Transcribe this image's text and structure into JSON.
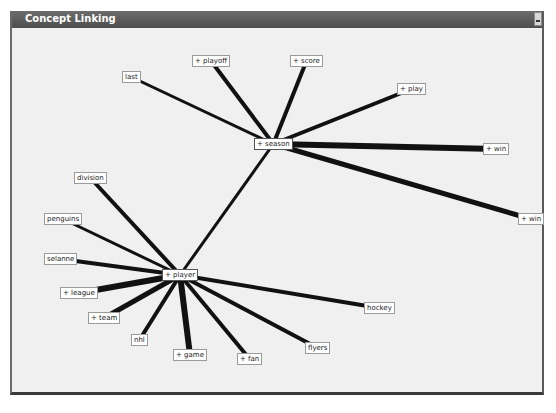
{
  "window": {
    "title": "Concept Linking",
    "minimize_label": ""
  },
  "graph": {
    "edge_color": "#111111",
    "nodes": [
      {
        "id": "season",
        "label": "+ season",
        "x": 254,
        "y": 138,
        "center": true
      },
      {
        "id": "player",
        "label": "+ player",
        "x": 162,
        "y": 269,
        "center": true
      },
      {
        "id": "last",
        "label": "last",
        "x": 122,
        "y": 71
      },
      {
        "id": "playoff",
        "label": "+ playoff",
        "x": 192,
        "y": 55
      },
      {
        "id": "score",
        "label": "+ score",
        "x": 290,
        "y": 55
      },
      {
        "id": "play",
        "label": "+ play",
        "x": 397,
        "y": 83
      },
      {
        "id": "win1",
        "label": "+ win",
        "x": 483,
        "y": 143
      },
      {
        "id": "win2",
        "label": "+ win",
        "x": 518,
        "y": 213
      },
      {
        "id": "division",
        "label": "division",
        "x": 74,
        "y": 172
      },
      {
        "id": "penguins",
        "label": "penguins",
        "x": 44,
        "y": 213
      },
      {
        "id": "selanne",
        "label": "selanne",
        "x": 44,
        "y": 253
      },
      {
        "id": "league",
        "label": "+ league",
        "x": 60,
        "y": 287
      },
      {
        "id": "team",
        "label": "+ team",
        "x": 88,
        "y": 312
      },
      {
        "id": "nhl",
        "label": "nhl",
        "x": 131,
        "y": 334
      },
      {
        "id": "game",
        "label": "+ game",
        "x": 173,
        "y": 349
      },
      {
        "id": "fan",
        "label": "+ fan",
        "x": 237,
        "y": 353
      },
      {
        "id": "flyers",
        "label": "flyers",
        "x": 305,
        "y": 342
      },
      {
        "id": "hockey",
        "label": "hockey",
        "x": 364,
        "y": 302
      }
    ],
    "edges": [
      {
        "from": "season",
        "to": "last",
        "w": 3
      },
      {
        "from": "season",
        "to": "playoff",
        "w": 4
      },
      {
        "from": "season",
        "to": "score",
        "w": 4
      },
      {
        "from": "season",
        "to": "play",
        "w": 4
      },
      {
        "from": "season",
        "to": "win1",
        "w": 6
      },
      {
        "from": "season",
        "to": "win2",
        "w": 5
      },
      {
        "from": "season",
        "to": "player",
        "w": 3
      },
      {
        "from": "player",
        "to": "division",
        "w": 4
      },
      {
        "from": "player",
        "to": "penguins",
        "w": 3
      },
      {
        "from": "player",
        "to": "selanne",
        "w": 4
      },
      {
        "from": "player",
        "to": "league",
        "w": 6
      },
      {
        "from": "player",
        "to": "team",
        "w": 5
      },
      {
        "from": "player",
        "to": "nhl",
        "w": 4
      },
      {
        "from": "player",
        "to": "game",
        "w": 6
      },
      {
        "from": "player",
        "to": "fan",
        "w": 4
      },
      {
        "from": "player",
        "to": "flyers",
        "w": 4
      },
      {
        "from": "player",
        "to": "hockey",
        "w": 4
      }
    ]
  }
}
